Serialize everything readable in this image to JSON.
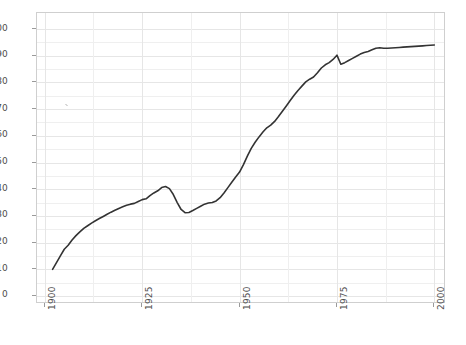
{
  "chart_data": {
    "type": "line",
    "title": "",
    "subtitle": "",
    "xlabel": "",
    "ylabel": "",
    "xlim": [
      1898,
      2003
    ],
    "ylim": [
      -3,
      106
    ],
    "grid": true,
    "legend": "none",
    "x_ticks": [
      1900,
      1925,
      1950,
      1975,
      2000
    ],
    "x_tick_labels": [
      "1900",
      "1925",
      "1950",
      "1975",
      "2000"
    ],
    "y_ticks": [
      0,
      10,
      20,
      30,
      40,
      50,
      60,
      70,
      80,
      90,
      100
    ],
    "y_tick_labels": [
      "0",
      "10",
      "20",
      "30",
      "40",
      "50",
      "60",
      "70",
      "80",
      "90",
      "100"
    ],
    "series": [
      {
        "name": "percent",
        "color": "#333333",
        "line_width": 1.6,
        "x": [
          1902,
          1903,
          1904,
          1905,
          1906,
          1907,
          1908,
          1909,
          1910,
          1911,
          1912,
          1913,
          1914,
          1915,
          1916,
          1917,
          1918,
          1919,
          1920,
          1921,
          1922,
          1923,
          1924,
          1925,
          1926,
          1927,
          1928,
          1929,
          1930,
          1931,
          1932,
          1933,
          1934,
          1935,
          1936,
          1937,
          1938,
          1939,
          1940,
          1941,
          1942,
          1943,
          1944,
          1945,
          1946,
          1947,
          1948,
          1949,
          1950,
          1951,
          1952,
          1953,
          1954,
          1955,
          1956,
          1957,
          1958,
          1959,
          1960,
          1961,
          1962,
          1963,
          1964,
          1965,
          1966,
          1967,
          1968,
          1969,
          1970,
          1971,
          1972,
          1973,
          1974,
          1975,
          1976,
          1977,
          1978,
          1979,
          1980,
          1981,
          1982,
          1983,
          1984,
          1985,
          1986,
          1987,
          1988,
          1989,
          1990,
          1991,
          1992,
          1993,
          1994,
          1995,
          1996,
          1997,
          1998,
          1999,
          2000
        ],
        "y": [
          10.0,
          12.5,
          15.0,
          17.5,
          19.0,
          21.0,
          22.6,
          24.0,
          25.3,
          26.3,
          27.3,
          28.2,
          29.0,
          29.8,
          30.6,
          31.4,
          32.1,
          32.8,
          33.4,
          34.0,
          34.4,
          34.7,
          35.4,
          36.1,
          36.4,
          37.6,
          38.6,
          39.4,
          40.6,
          41.0,
          40.2,
          38.0,
          35.0,
          32.4,
          31.2,
          31.3,
          32.0,
          32.8,
          33.6,
          34.4,
          34.8,
          35.0,
          35.6,
          36.8,
          38.6,
          40.6,
          42.6,
          44.6,
          46.4,
          49.2,
          52.4,
          55.3,
          57.6,
          59.6,
          61.4,
          63.0,
          64.0,
          65.4,
          67.2,
          69.2,
          71.2,
          73.2,
          75.2,
          77.0,
          78.6,
          80.2,
          81.2,
          82.0,
          83.6,
          85.4,
          86.6,
          87.4,
          88.6,
          90.2,
          86.8,
          87.4,
          88.2,
          89.0,
          89.8,
          90.6,
          91.2,
          91.6,
          92.2,
          92.8,
          93.0,
          92.8,
          92.8,
          92.9,
          93.0,
          93.1,
          93.2,
          93.3,
          93.4,
          93.5,
          93.6,
          93.7,
          93.8,
          93.9,
          94.0
        ]
      }
    ],
    "annotations": []
  }
}
